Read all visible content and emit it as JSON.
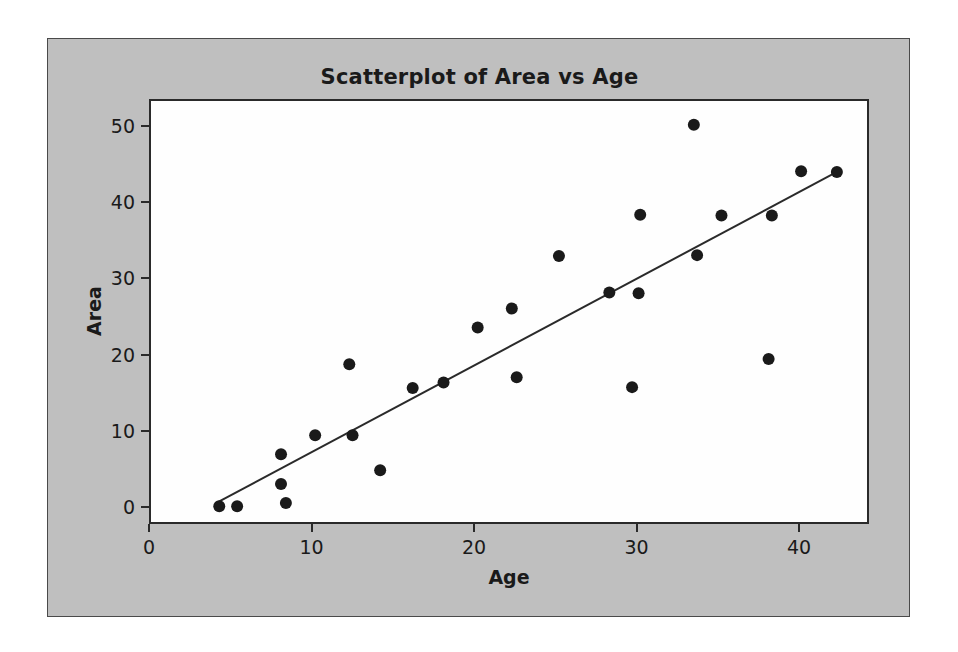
{
  "chart_data": {
    "type": "scatter",
    "title": "Scatterplot of Area vs Age",
    "xlabel": "Age",
    "ylabel": "Area",
    "xlim": [
      0,
      44.3
    ],
    "ylim": [
      -2.2,
      53.5
    ],
    "xticks": [
      0,
      10,
      20,
      30,
      40
    ],
    "yticks": [
      0,
      10,
      20,
      30,
      40,
      50
    ],
    "xtick_labels": [
      "0",
      "10",
      "20",
      "30",
      "40"
    ],
    "ytick_labels": [
      "0",
      "10",
      "20",
      "30",
      "40",
      "50"
    ],
    "grid": false,
    "legend": null,
    "marker": {
      "shape": "circle",
      "color": "#1a1a1a",
      "size": 12
    },
    "points": [
      {
        "x": 4.2,
        "y": 0.4
      },
      {
        "x": 5.3,
        "y": 0.4
      },
      {
        "x": 8.0,
        "y": 7.2
      },
      {
        "x": 8.0,
        "y": 3.3
      },
      {
        "x": 8.3,
        "y": 0.8
      },
      {
        "x": 10.1,
        "y": 9.7
      },
      {
        "x": 12.2,
        "y": 19.0
      },
      {
        "x": 12.4,
        "y": 9.7
      },
      {
        "x": 14.1,
        "y": 5.1
      },
      {
        "x": 16.1,
        "y": 15.9
      },
      {
        "x": 18.0,
        "y": 16.6
      },
      {
        "x": 20.1,
        "y": 23.8
      },
      {
        "x": 22.2,
        "y": 26.3
      },
      {
        "x": 22.5,
        "y": 17.3
      },
      {
        "x": 25.1,
        "y": 33.2
      },
      {
        "x": 28.2,
        "y": 28.4
      },
      {
        "x": 29.6,
        "y": 16.0
      },
      {
        "x": 30.0,
        "y": 28.3
      },
      {
        "x": 30.1,
        "y": 38.6
      },
      {
        "x": 33.4,
        "y": 50.4
      },
      {
        "x": 33.6,
        "y": 33.3
      },
      {
        "x": 35.1,
        "y": 38.5
      },
      {
        "x": 38.0,
        "y": 19.7
      },
      {
        "x": 38.2,
        "y": 38.5
      },
      {
        "x": 40.0,
        "y": 44.3
      },
      {
        "x": 42.2,
        "y": 44.2
      }
    ],
    "fit_line": {
      "type": "linear-regression",
      "color": "#2a2a2a",
      "width": 2,
      "x_start": 4.0,
      "y_start": 0.8,
      "x_end": 42.2,
      "y_end": 44.2
    }
  },
  "style": {
    "panel_background": "#bfbfbf",
    "plot_background": "#fefefe",
    "axis_color": "#2a2a2a",
    "text_color": "#1a1a1a"
  }
}
